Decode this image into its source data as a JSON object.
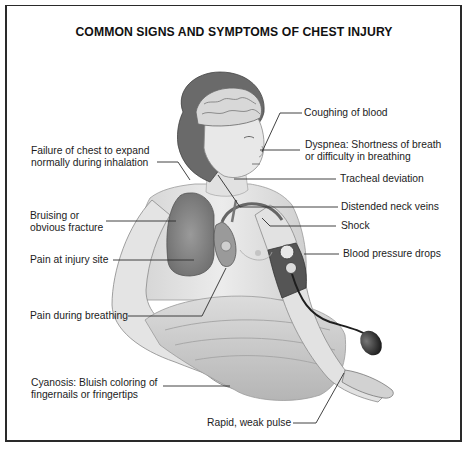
{
  "title": "COMMON SIGNS AND SYMPTOMS OF CHEST INJURY",
  "illustration": {
    "subject": "seated patient with visible brain, lungs and heart; blood pressure cuff on right arm",
    "colors": {
      "skin": "#e6e6e6",
      "shadow": "#bdbdbd",
      "hair": "#6e6e6e",
      "lung": "#8c8c8c",
      "cuff": "#5a5a5a",
      "bulb": "#2e2e2e",
      "sheet": "#c9c9c9",
      "line": "#333333",
      "border": "#2a2a2a"
    }
  },
  "labels_left": [
    {
      "id": "failure",
      "lines": [
        "Failure of chest to expand",
        "normally during inhalation"
      ]
    },
    {
      "id": "bruising",
      "lines": [
        "Bruising or",
        "obvious fracture"
      ]
    },
    {
      "id": "pain-site",
      "lines": [
        "Pain at injury site"
      ]
    },
    {
      "id": "pain-breathing",
      "lines": [
        "Pain during breathing"
      ]
    },
    {
      "id": "cyanosis",
      "lines": [
        "Cyanosis: Bluish coloring of",
        "fingernails or fringertips"
      ]
    }
  ],
  "labels_right": [
    {
      "id": "coughing",
      "lines": [
        "Coughing of blood"
      ]
    },
    {
      "id": "dyspnea",
      "lines": [
        "Dyspnea: Shortness of breath",
        "or difficulty in breathing"
      ]
    },
    {
      "id": "tracheal",
      "lines": [
        "Tracheal deviation"
      ]
    },
    {
      "id": "neck-veins",
      "lines": [
        "Distended neck veins"
      ]
    },
    {
      "id": "shock",
      "lines": [
        "Shock"
      ]
    },
    {
      "id": "bp",
      "lines": [
        "Blood pressure drops"
      ]
    }
  ],
  "labels_bottom": [
    {
      "id": "pulse",
      "lines": [
        "Rapid, weak pulse"
      ]
    }
  ]
}
